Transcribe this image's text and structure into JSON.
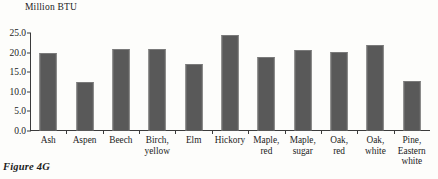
{
  "caption": "Figure 4G",
  "chart_data": {
    "type": "bar",
    "title": "",
    "axis_title": "Million\nBTU",
    "ylabel": "Million BTU",
    "xlabel": "",
    "ylim": [
      0.0,
      25.0
    ],
    "ytick_step": 5.0,
    "ytick_labels": [
      "25.0",
      "20.0",
      "15.0",
      "10.0",
      "5.0",
      "0.0"
    ],
    "ytick_values": [
      25.0,
      20.0,
      15.0,
      10.0,
      5.0,
      0.0
    ],
    "grid": false,
    "legend": "none",
    "bar_color": "#595959",
    "axis_color": "#3b3b3b",
    "background_color": "#fdfdfb",
    "categories": [
      "Ash",
      "Aspen",
      "Beech",
      "Birch,\nyellow",
      "Elm",
      "Hickory",
      "Maple,\nred",
      "Maple,\nsugar",
      "Oak,\nred",
      "Oak,\nwhite",
      "Pine,\nEastern\nwhite"
    ],
    "values": [
      20.0,
      12.5,
      21.0,
      20.8,
      17.2,
      24.5,
      19.0,
      20.6,
      20.1,
      22.0,
      12.8
    ]
  }
}
